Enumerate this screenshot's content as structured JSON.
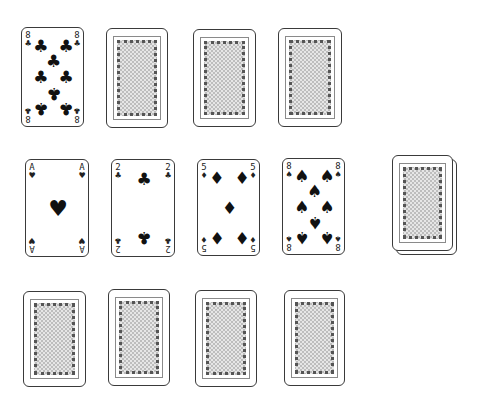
{
  "game": "solitaire-style card layout",
  "colors": {
    "card_border": "#3a3a3a",
    "pip": "#111111",
    "back_pattern": "#bdbdbd"
  },
  "rows": [
    {
      "name": "row-top",
      "cards": [
        {
          "face": "up",
          "rank": "8",
          "suit": "clubs",
          "suit_glyph": "♣",
          "x": 21,
          "y": 27,
          "w": 63,
          "h": 100
        },
        {
          "face": "down",
          "x": 106,
          "y": 28,
          "w": 62,
          "h": 100
        },
        {
          "face": "down",
          "x": 193,
          "y": 29,
          "w": 63,
          "h": 98
        },
        {
          "face": "down",
          "x": 278,
          "y": 28,
          "w": 64,
          "h": 99
        }
      ]
    },
    {
      "name": "row-middle",
      "cards": [
        {
          "face": "up",
          "rank": "A",
          "suit": "hearts",
          "suit_glyph": "♥",
          "x": 25,
          "y": 159,
          "w": 64,
          "h": 98
        },
        {
          "face": "up",
          "rank": "2",
          "suit": "clubs",
          "suit_glyph": "♣",
          "x": 111,
          "y": 159,
          "w": 64,
          "h": 98
        },
        {
          "face": "up",
          "rank": "5",
          "suit": "diamonds",
          "suit_glyph": "♦",
          "x": 197,
          "y": 159,
          "w": 63,
          "h": 97
        },
        {
          "face": "up",
          "rank": "8",
          "suit": "spades",
          "suit_glyph": "♠",
          "x": 282,
          "y": 158,
          "w": 63,
          "h": 97
        }
      ]
    },
    {
      "name": "row-bottom",
      "cards": [
        {
          "face": "down",
          "x": 23,
          "y": 291,
          "w": 63,
          "h": 96
        },
        {
          "face": "down",
          "x": 108,
          "y": 289,
          "w": 62,
          "h": 97
        },
        {
          "face": "down",
          "x": 195,
          "y": 290,
          "w": 62,
          "h": 97
        },
        {
          "face": "down",
          "x": 284,
          "y": 290,
          "w": 61,
          "h": 96
        }
      ]
    }
  ],
  "deck": {
    "face": "down",
    "stacked": 2,
    "x": 392,
    "y": 155,
    "w": 61,
    "h": 96,
    "offset": 4
  }
}
